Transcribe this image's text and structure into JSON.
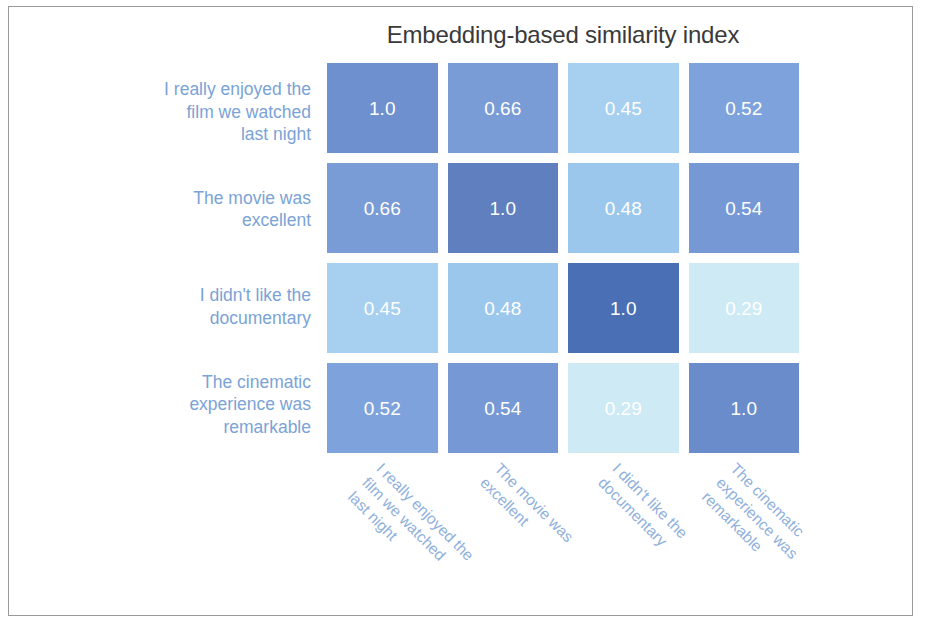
{
  "figure": {
    "title": "Embedding-based similarity index",
    "border_color": "#9a9a9a",
    "background": "#ffffff",
    "tick_label_color": "#7ba3d6",
    "cell_text_color": "#ffffff"
  },
  "chart_data": {
    "type": "heatmap",
    "title": "Embedding-based similarity index",
    "xlabel": "",
    "ylabel": "",
    "grid": false,
    "legend": "none",
    "colormap": "blues_light_to_dark",
    "vmin": 0.29,
    "vmax": 1.0,
    "categories": [
      "I really enjoyed the film we watched last night",
      "The movie was excellent",
      "I didn't like the documentary",
      "The cinematic experience was remarkable"
    ],
    "xticklabels": [
      "I really enjoyed the film we watched last night",
      "The movie was excellent",
      "I didn't like the documentary",
      "The cinematic experience was remarkable"
    ],
    "yticklabels": [
      "I really enjoyed the film we watched last night",
      "The movie was excellent",
      "I didn't like the documentary",
      "The cinematic experience was remarkable"
    ],
    "xticklabel_lines": [
      [
        "I really enjoyed the",
        "film we watched",
        "last night"
      ],
      [
        "The movie was",
        "excellent"
      ],
      [
        "I didn't like the",
        "documentary"
      ],
      [
        "The cinematic",
        "experience was",
        "remarkable"
      ]
    ],
    "yticklabel_lines": [
      [
        "I really enjoyed the",
        "film we watched",
        "last night"
      ],
      [
        "The movie was",
        "excellent"
      ],
      [
        "I didn't like the",
        "documentary"
      ],
      [
        "The cinematic",
        "experience was",
        "remarkable"
      ]
    ],
    "values": [
      [
        1.0,
        0.66,
        0.45,
        0.52
      ],
      [
        0.66,
        1.0,
        0.48,
        0.54
      ],
      [
        0.45,
        0.48,
        1.0,
        0.29
      ],
      [
        0.52,
        0.54,
        0.29,
        1.0
      ]
    ],
    "annotations": [
      [
        "1.0",
        "0.66",
        "0.45",
        "0.52"
      ],
      [
        "0.66",
        "1.0",
        "0.48",
        "0.54"
      ],
      [
        "0.45",
        "0.48",
        "1.0",
        "0.29"
      ],
      [
        "0.52",
        "0.54",
        "0.29",
        "1.0"
      ]
    ],
    "cell_colors": [
      [
        "#6e90cf",
        "#7a9cd6",
        "#a6cff0",
        "#7ea3dc"
      ],
      [
        "#7a9cd6",
        "#5f7fbe",
        "#9cc7ed",
        "#7699d6"
      ],
      [
        "#a6cff0",
        "#9cc7ed",
        "#4a6fb5",
        "#cdeaf5"
      ],
      [
        "#7ea3dc",
        "#7699d6",
        "#cdeaf5",
        "#6a8cca"
      ]
    ]
  }
}
